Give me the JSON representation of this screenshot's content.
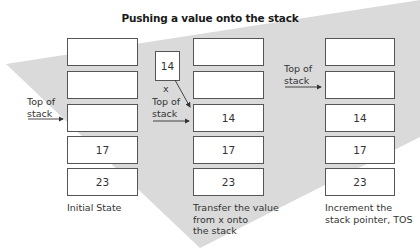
{
  "title": "Pushing a value onto the stack",
  "columns": [
    {
      "cells": [
        "",
        "",
        "",
        "17",
        "23"
      ],
      "top_of_stack_label": [
        "Top of",
        "stack"
      ],
      "caption": [
        "Initial State"
      ]
    },
    {
      "cells": [
        "",
        "",
        "14",
        "17",
        "23"
      ],
      "top_of_stack_label": [
        "Top of",
        "stack"
      ],
      "caption": [
        "Transfer the value",
        "from x onto",
        "the stack"
      ],
      "variable": {
        "name": "x",
        "value": "14"
      }
    },
    {
      "cells": [
        "",
        "",
        "14",
        "17",
        "23"
      ],
      "top_of_stack_label": [
        "Top of",
        "stack"
      ],
      "caption": [
        "Increment the",
        "stack pointer, TOS"
      ]
    }
  ],
  "colors": {
    "background": "#ffffff",
    "shape": "#d9d9d9",
    "border": "#555555"
  }
}
